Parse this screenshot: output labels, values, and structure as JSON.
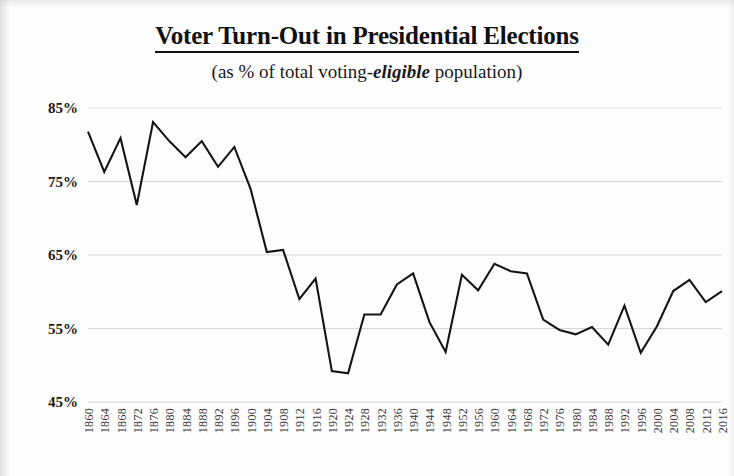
{
  "title": "Voter Turn-Out in Presidential Elections",
  "subtitle_before": "(as % of total voting-",
  "subtitle_emph": "eligible",
  "subtitle_after": " population)",
  "axis": {
    "y_ticks": [
      "85%",
      "75%",
      "65%",
      "55%",
      "45%"
    ]
  },
  "chart_data": {
    "type": "line",
    "title": "Voter Turn-Out in Presidential Elections",
    "subtitle": "(as % of total voting-eligible population)",
    "xlabel": "",
    "ylabel": "",
    "ylim": [
      45,
      85
    ],
    "ytick_values": [
      85,
      75,
      65,
      55,
      45
    ],
    "ytick_labels": [
      "85%",
      "75%",
      "65%",
      "55%",
      "45%"
    ],
    "grid": "horizontal",
    "legend": "none",
    "line_color": "#141414",
    "categories": [
      "1860",
      "1864",
      "1868",
      "1872",
      "1876",
      "1880",
      "1884",
      "1888",
      "1892",
      "1896",
      "1900",
      "1904",
      "1908",
      "1912",
      "1916",
      "1920",
      "1924",
      "1928",
      "1932",
      "1936",
      "1940",
      "1944",
      "1948",
      "1952",
      "1956",
      "1960",
      "1964",
      "1968",
      "1972",
      "1976",
      "1980",
      "1984",
      "1988",
      "1992",
      "1996",
      "2000",
      "2004",
      "2008",
      "2012",
      "2016"
    ],
    "values": [
      81.8,
      76.3,
      80.9,
      71.8,
      83.1,
      80.5,
      78.3,
      80.5,
      77.0,
      79.7,
      74.0,
      65.4,
      65.7,
      59.0,
      61.8,
      49.2,
      48.9,
      56.9,
      56.9,
      61.0,
      62.5,
      55.9,
      51.8,
      62.3,
      60.2,
      63.8,
      62.8,
      62.5,
      56.2,
      54.8,
      54.2,
      55.2,
      52.8,
      58.1,
      51.7,
      55.3,
      60.1,
      61.6,
      58.6,
      60.1
    ]
  }
}
